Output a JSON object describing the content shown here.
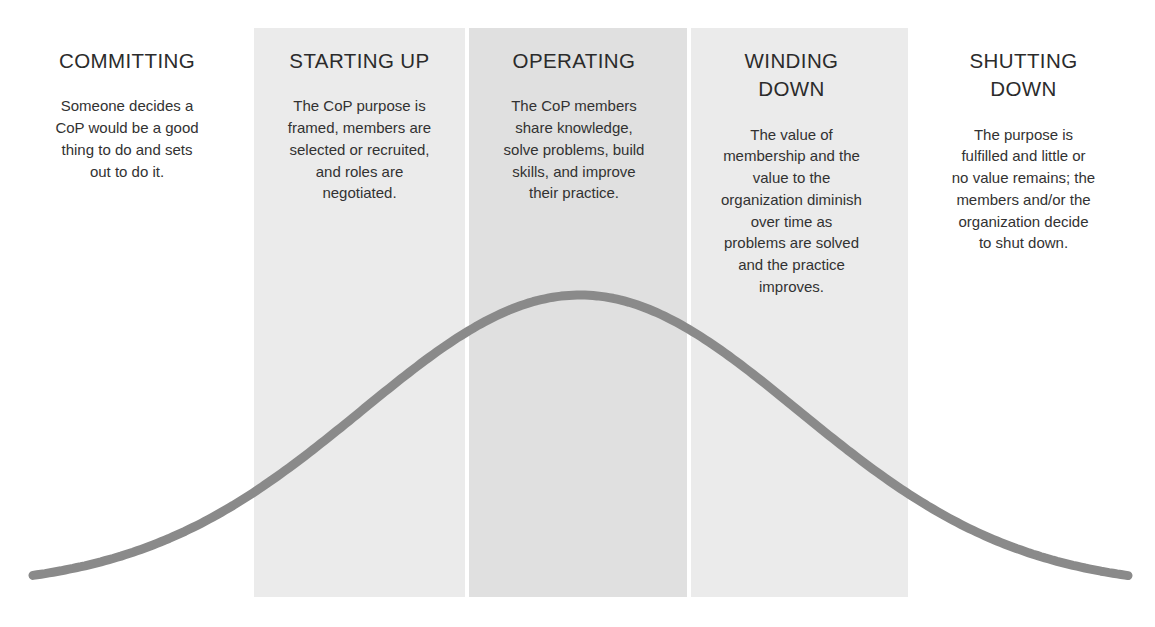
{
  "diagram": {
    "curve": {
      "type": "bell-curve",
      "color": "#8a8a8a",
      "stroke_width": 9,
      "peak_x": 580,
      "peak_y": 295,
      "baseline_y": 588,
      "start_x": 33,
      "end_x": 1128
    },
    "band_colors": {
      "committing": "#ffffff",
      "starting_up": "#ebebeb",
      "operating": "#e0e0e0",
      "winding_down": "#ebebeb",
      "shutting_down": "#ffffff"
    },
    "stages": [
      {
        "id": "committing",
        "title": "COMMITTING",
        "description": "Someone decides a\nCoP would be a good\nthing to do and sets\nout to do it.",
        "band_left": 0,
        "band_width": 254,
        "band_color": "#ffffff",
        "text_width": 218
      },
      {
        "id": "starting-up",
        "title": "STARTING UP",
        "description": "The CoP purpose is\nframed, members are\nselected or recruited,\nand roles are\nnegotiated.",
        "band_left": 254,
        "band_width": 211,
        "band_color": "#ebebeb",
        "text_width": 200
      },
      {
        "id": "operating",
        "title": "OPERATING",
        "description": "The CoP members\nshare knowledge,\nsolve problems, build\nskills, and improve\ntheir practice.",
        "band_left": 469,
        "band_width": 218,
        "band_color": "#e0e0e0",
        "text_width": 200
      },
      {
        "id": "winding-down",
        "title": "WINDING\nDOWN",
        "description": "The value of\nmembership and the\nvalue to the\norganization diminish\nover time as\nproblems are solved\nand the practice\nimproves.",
        "band_left": 691,
        "band_width": 217,
        "band_color": "#ebebeb",
        "text_width": 205
      },
      {
        "id": "shutting-down",
        "title": "SHUTTING\nDOWN",
        "description": "The purpose is\nfulfilled and little or\nno value remains; the\nmembers and/or the\norganization decide\nto shut down.",
        "band_left": 908,
        "band_width": 247,
        "band_color": "#ffffff",
        "text_width": 215
      }
    ]
  }
}
